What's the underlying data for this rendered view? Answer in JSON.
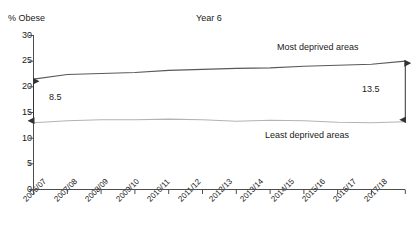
{
  "chart_data": {
    "type": "line",
    "title": "Year 6",
    "ylabel": "% Obese",
    "xlabel": "",
    "ylim": [
      0,
      30
    ],
    "ytick_values": [
      0,
      5,
      10,
      15,
      20,
      25,
      30
    ],
    "ytick_labels": [
      "0",
      "5",
      "10",
      "15",
      "20",
      "25",
      "30"
    ],
    "grid": false,
    "legend_position": "inline-annotation",
    "categories": [
      "2006/07",
      "2007/08",
      "2008/09",
      "2009/10",
      "2010/11",
      "2011/12",
      "2012/13",
      "2013/14",
      "2014/15",
      "2015/16",
      "2016/17",
      "2017/18"
    ],
    "series": [
      {
        "name": "Most deprived areas",
        "values": [
          21.5,
          22.4,
          22.6,
          22.8,
          23.2,
          23.4,
          23.6,
          23.7,
          24.0,
          24.2,
          24.4,
          25.0
        ]
      },
      {
        "name": "Least deprived areas",
        "values": [
          13.0,
          13.4,
          13.6,
          13.6,
          13.7,
          13.6,
          13.3,
          13.5,
          13.4,
          13.1,
          13.0,
          13.2
        ]
      }
    ],
    "annotations": [
      {
        "name": "gap-first-year",
        "label": "8.5",
        "category": "2006/07",
        "from_value": 21.5,
        "to_value": 13.0
      },
      {
        "name": "gap-last-year",
        "label": "13.5",
        "category": "2017/18",
        "from_value": 25.0,
        "to_value": 13.2
      }
    ]
  },
  "chart": {
    "y_axis_title": "% Obese",
    "title": "Year 6",
    "series_label_most": "Most deprived areas",
    "series_label_least": "Least deprived areas",
    "gap_label_left": "8.5",
    "gap_label_right": "13.5",
    "ytick_0": "0",
    "ytick_1": "5",
    "ytick_2": "10",
    "ytick_3": "15",
    "ytick_4": "20",
    "ytick_5": "25",
    "ytick_6": "30",
    "xtick_0": "2006/07",
    "xtick_1": "2007/08",
    "xtick_2": "2008/09",
    "xtick_3": "2009/10",
    "xtick_4": "2010/11",
    "xtick_5": "2011/12",
    "xtick_6": "2012/13",
    "xtick_7": "2013/14",
    "xtick_8": "2014/15",
    "xtick_9": "2015/16",
    "xtick_10": "2016/17",
    "xtick_11": "2017/18"
  },
  "colors": {
    "axis": "#4d4d4d",
    "series_most": "#595959",
    "series_least": "#b3b3b3",
    "annotation": "#333333",
    "text": "#1a1a1a",
    "background": "#ffffff"
  }
}
